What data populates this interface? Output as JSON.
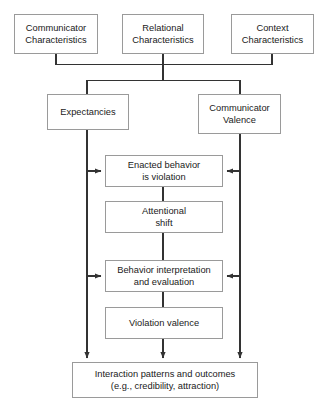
{
  "diagram": {
    "background_color": "#ffffff",
    "box_border_color": "#9a9a9a",
    "line_color": "#333333",
    "text_color": "#1a1a1a",
    "nodes": [
      {
        "id": "communicator-characteristics",
        "label": "Communicator\nCharacteristics",
        "x": 14,
        "y": 14,
        "w": 84,
        "h": 40
      },
      {
        "id": "relational-characteristics",
        "label": "Relational\nCharacteristics",
        "x": 122,
        "y": 14,
        "w": 82,
        "h": 40
      },
      {
        "id": "context-characteristics",
        "label": "Context\nCharacteristics",
        "x": 231,
        "y": 14,
        "w": 83,
        "h": 40
      },
      {
        "id": "expectancies",
        "label": "Expectancies",
        "x": 47,
        "y": 94,
        "w": 82,
        "h": 36
      },
      {
        "id": "communicator-valence",
        "label": "Communicator\nValence",
        "x": 198,
        "y": 94,
        "w": 83,
        "h": 40
      },
      {
        "id": "enacted-behavior-is-violation",
        "label": "Enacted behavior\nis violation",
        "x": 105,
        "y": 155,
        "w": 118,
        "h": 32
      },
      {
        "id": "attentional-shift",
        "label": "Attentional\nshift",
        "x": 105,
        "y": 201,
        "w": 118,
        "h": 32
      },
      {
        "id": "behavior-interpretation-and-evaluation",
        "label": "Behavior interpretation\nand evaluation",
        "x": 105,
        "y": 260,
        "w": 118,
        "h": 32
      },
      {
        "id": "violation-valence",
        "label": "Violation valence",
        "x": 105,
        "y": 307,
        "w": 118,
        "h": 32
      },
      {
        "id": "interaction-patterns-and-outcomes",
        "label": "Interaction patterns and outcomes\n(e.g., credibility, attraction)",
        "x": 72,
        "y": 362,
        "w": 186,
        "h": 36
      }
    ],
    "edges": [
      {
        "id": "communicator-char-down",
        "from": "communicator-characteristics",
        "to": "distribution-bus",
        "arrow": false
      },
      {
        "id": "relational-char-down",
        "from": "relational-characteristics",
        "to": "distribution-bus",
        "arrow": false
      },
      {
        "id": "context-char-down",
        "from": "context-characteristics",
        "to": "distribution-bus",
        "arrow": false
      },
      {
        "id": "bus-to-expectancies",
        "from": "distribution-bus",
        "to": "expectancies",
        "arrow": false
      },
      {
        "id": "bus-to-communicator-valence",
        "from": "distribution-bus",
        "to": "communicator-valence",
        "arrow": false
      },
      {
        "id": "expectancies-to-enacted-behavior",
        "from": "expectancies",
        "to": "enacted-behavior-is-violation",
        "arrow": true
      },
      {
        "id": "communicator-valence-to-enacted-behavior",
        "from": "communicator-valence",
        "to": "enacted-behavior-is-violation",
        "arrow": true
      },
      {
        "id": "expectancies-to-behavior-interpretation",
        "from": "expectancies",
        "to": "behavior-interpretation-and-evaluation",
        "arrow": true
      },
      {
        "id": "communicator-valence-to-behavior-interpretation",
        "from": "communicator-valence",
        "to": "behavior-interpretation-and-evaluation",
        "arrow": true
      },
      {
        "id": "enacted-behavior-to-attentional-shift",
        "from": "enacted-behavior-is-violation",
        "to": "attentional-shift",
        "arrow": false
      },
      {
        "id": "attentional-shift-to-behavior-interpretation",
        "from": "attentional-shift",
        "to": "behavior-interpretation-and-evaluation",
        "arrow": false
      },
      {
        "id": "behavior-interpretation-to-violation-valence",
        "from": "behavior-interpretation-and-evaluation",
        "to": "violation-valence",
        "arrow": false
      },
      {
        "id": "violation-valence-to-outcomes",
        "from": "violation-valence",
        "to": "interaction-patterns-and-outcomes",
        "arrow": true
      },
      {
        "id": "expectancies-to-outcomes",
        "from": "expectancies",
        "to": "interaction-patterns-and-outcomes",
        "arrow": true
      },
      {
        "id": "communicator-valence-to-outcomes",
        "from": "communicator-valence",
        "to": "interaction-patterns-and-outcomes",
        "arrow": true
      }
    ]
  }
}
